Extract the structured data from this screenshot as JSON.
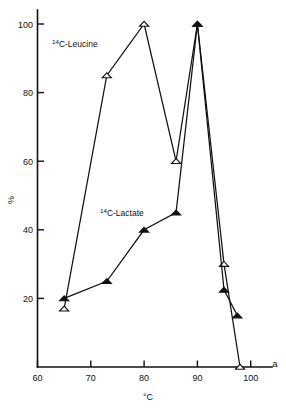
{
  "figure": {
    "panel_label": "a"
  },
  "chart_data": {
    "type": "line",
    "title": "",
    "subtitle": "",
    "xlabel": "°C",
    "ylabel": "%",
    "xlim": [
      60,
      104
    ],
    "ylim": [
      0,
      105
    ],
    "xticks": [
      60,
      70,
      80,
      90,
      100
    ],
    "xticklabels": [
      "60",
      "70",
      "80",
      "90",
      "100"
    ],
    "yticks": [
      20,
      40,
      60,
      80,
      100
    ],
    "yticklabels": [
      "20",
      "40",
      "60",
      "80",
      "100"
    ],
    "grid": false,
    "legend_position": "inline-annotations",
    "series": [
      {
        "name": "14C-Leucine",
        "name_sup": "14",
        "name_rest": "C-Leucine",
        "marker": "open-triangle",
        "color": "#111111",
        "x": [
          65,
          73,
          80,
          86,
          90,
          95,
          98
        ],
        "values": [
          17,
          85,
          100,
          60,
          100,
          30,
          0
        ]
      },
      {
        "name": "14C-Lactate",
        "name_sup": "14",
        "name_rest": "C-Lactate",
        "marker": "filled-triangle",
        "color": "#111111",
        "x": [
          65,
          73,
          80,
          86,
          90,
          95,
          97.5
        ],
        "values": [
          20,
          25,
          40,
          45,
          100,
          22.5,
          15
        ]
      }
    ],
    "annotations": [
      {
        "text": "14C-Leucine",
        "x": 71,
        "y": 93
      },
      {
        "text": "14C-Lactate",
        "x": 80.5,
        "y": 47
      }
    ]
  }
}
